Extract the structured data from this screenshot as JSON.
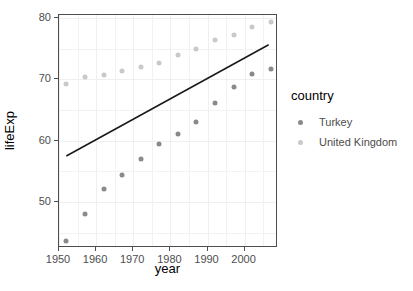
{
  "chart_data": {
    "type": "scatter",
    "title": "",
    "xlabel": "year",
    "ylabel": "lifeExp",
    "xlim": [
      1950,
      2009
    ],
    "ylim": [
      42.5,
      80.5
    ],
    "xticks": [
      1950,
      1960,
      1970,
      1980,
      1990,
      2000
    ],
    "yticks": [
      50,
      60,
      70,
      80
    ],
    "grid": true,
    "legend": {
      "title": "country",
      "position": "right",
      "entries": [
        {
          "name": "Turkey",
          "color": "#8a8a8a"
        },
        {
          "name": "United Kingdom",
          "color": "#c9c9c9"
        }
      ]
    },
    "x": [
      1952,
      1957,
      1962,
      1967,
      1972,
      1977,
      1982,
      1987,
      1992,
      1997,
      2002,
      2007
    ],
    "series": [
      {
        "name": "Turkey",
        "color": "#8a8a8a",
        "values": [
          43.58,
          48.08,
          52.1,
          54.34,
          57.01,
          59.51,
          61.04,
          63.11,
          66.15,
          68.84,
          70.85,
          71.78
        ]
      },
      {
        "name": "United Kingdom",
        "color": "#c9c9c9",
        "values": [
          69.18,
          70.42,
          70.76,
          71.36,
          72.01,
          72.76,
          74.04,
          75.01,
          76.42,
          77.22,
          78.47,
          79.43
        ]
      }
    ],
    "annotations": [
      {
        "type": "regression-line",
        "color": "#1a1a1a",
        "x_start": 1952,
        "y_start": 57.3,
        "x_end": 2007,
        "y_end": 75.6
      }
    ]
  }
}
